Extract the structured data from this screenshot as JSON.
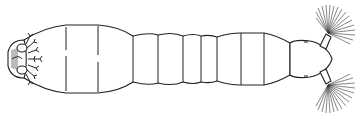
{
  "figure": {
    "subject": "line drawing of an aquatic insect larva, dorsal view",
    "colors": {
      "line": "#222222",
      "background": "#ffffff"
    },
    "parts": [
      "posterior-end-with-gills",
      "body-segments",
      "head",
      "left-antennal-fan",
      "right-antennal-fan"
    ]
  }
}
